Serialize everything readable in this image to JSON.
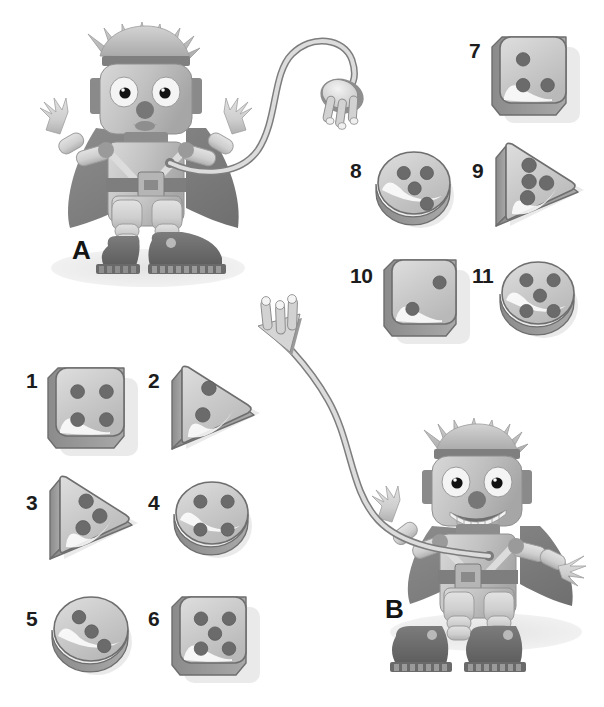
{
  "page": {
    "background_color": "#ffffff",
    "palette": {
      "ink": "#1c1c1c",
      "shape_face": "#c9c9c9",
      "shape_face_light": "#dcdcdc",
      "shape_side": "#8e8e8e",
      "shape_outline": "#6e6e6e",
      "dot": "#6b6b6b",
      "dot_dark": "#5e5e5e",
      "shadow": "#d9d9d9",
      "robot_body": "#bdbdbd",
      "robot_body_light": "#d6d6d6",
      "robot_dark": "#7a7a7a",
      "robot_darker": "#5d5d5d",
      "cord": "#d0d0d0",
      "cord_outline": "#7d7d7d",
      "ground_shadow": "#e6e6e6"
    }
  },
  "robots": [
    {
      "id": "robot-a",
      "label": "A",
      "label_x": 72,
      "label_y": 237,
      "plug_type": "round-3-prong",
      "description": "Robot A with cord ending in a round three-prong plug"
    },
    {
      "id": "robot-b",
      "label": "B",
      "label_x": 385,
      "label_y": 596,
      "plug_type": "triangle-3-prong",
      "description": "Robot B with cord ending in a triangular three-prong plug"
    }
  ],
  "shapes": [
    {
      "number": "1",
      "form": "square",
      "dots": 4,
      "pattern": "four-corners",
      "label_x": 26,
      "label_y": 370,
      "shape_x": 48,
      "shape_y": 366,
      "size": 84
    },
    {
      "number": "2",
      "form": "triangle",
      "dots": 2,
      "pattern": "left-column-two",
      "label_x": 148,
      "label_y": 370,
      "shape_x": 170,
      "shape_y": 363,
      "size": 88
    },
    {
      "number": "3",
      "form": "triangle",
      "dots": 3,
      "pattern": "three-cluster",
      "label_x": 26,
      "label_y": 492,
      "shape_x": 48,
      "shape_y": 473,
      "size": 88
    },
    {
      "number": "4",
      "form": "circle",
      "dots": 4,
      "pattern": "four-corners",
      "label_x": 148,
      "label_y": 492,
      "shape_x": 172,
      "shape_y": 478,
      "size": 80
    },
    {
      "number": "5",
      "form": "circle",
      "dots": 3,
      "pattern": "diagonal-three",
      "label_x": 26,
      "label_y": 608,
      "shape_x": 50,
      "shape_y": 593,
      "size": 82
    },
    {
      "number": "6",
      "form": "square",
      "dots": 5,
      "pattern": "quincunx",
      "label_x": 148,
      "label_y": 608,
      "shape_x": 172,
      "shape_y": 595,
      "size": 82
    },
    {
      "number": "7",
      "form": "square",
      "dots": 3,
      "pattern": "corner-three",
      "label_x": 469,
      "label_y": 40,
      "shape_x": 492,
      "shape_y": 35,
      "size": 82
    },
    {
      "number": "8",
      "form": "circle",
      "dots": 4,
      "pattern": "center-three-plus",
      "label_x": 350,
      "label_y": 160,
      "shape_x": 374,
      "shape_y": 148,
      "size": 80
    },
    {
      "number": "9",
      "form": "triangle",
      "dots": 4,
      "pattern": "column-three-plus",
      "label_x": 472,
      "label_y": 160,
      "shape_x": 494,
      "shape_y": 140,
      "size": 88
    },
    {
      "number": "10",
      "form": "square",
      "dots": 2,
      "pattern": "two-diagonal",
      "label_x": 350,
      "label_y": 265,
      "shape_x": 384,
      "shape_y": 258,
      "size": 80
    },
    {
      "number": "11",
      "form": "circle",
      "dots": 5,
      "pattern": "quincunx",
      "label_x": 472,
      "label_y": 265,
      "shape_x": 498,
      "shape_y": 258,
      "size": 80
    }
  ]
}
